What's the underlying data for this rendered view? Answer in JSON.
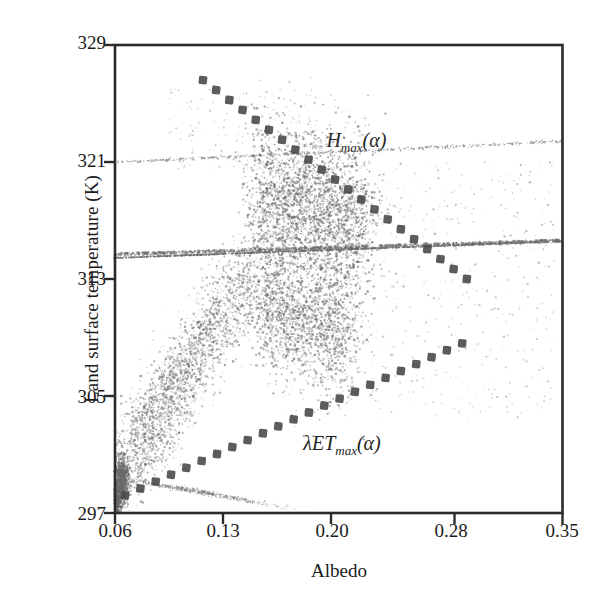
{
  "chart_data": {
    "type": "scatter",
    "title": "",
    "xlabel": "Albedo",
    "ylabel": "Land surface temperature (K)",
    "xlim": [
      0.06,
      0.35
    ],
    "ylim": [
      297,
      329
    ],
    "xticks": [
      "0.06",
      "0.13",
      "0.20",
      "0.28",
      "0.35"
    ],
    "xtick_values": [
      0.06,
      0.13,
      0.2,
      0.28,
      0.35
    ],
    "yticks": [
      "329",
      "321",
      "313",
      "305",
      "297"
    ],
    "ytick_values": [
      329,
      321,
      313,
      305,
      297
    ],
    "grid": false,
    "legend": "none",
    "point_color": "#6a6a6a",
    "cloud": {
      "center_x": 0.152,
      "center_y": 314.5,
      "dense_core_x": 0.152,
      "dense_core_y": 314.8,
      "warm_vertex_x": 0.143,
      "warm_vertex_y": 322.0,
      "dry_tail_x": 0.065,
      "dry_tail_y": 299.0
    },
    "annotations": [
      {
        "id": "hmax",
        "base": "H",
        "sub": "max",
        "arg": "(α)",
        "x": 0.197,
        "y": 322.3
      },
      {
        "id": "letmax",
        "base": "λET",
        "sub": "max",
        "arg": "(α)",
        "x": 0.182,
        "y": 301.6
      }
    ],
    "edges": [
      {
        "id": "hmax-edge",
        "label": "H_max(alpha)",
        "style": "dashed-square",
        "color": "#4a4a4a",
        "x_start": 0.117,
        "y_start": 326.6,
        "x_end": 0.288,
        "y_end": 313.0
      },
      {
        "id": "letmax-edge",
        "label": "lambdaET_max(alpha)",
        "style": "dashed-square",
        "color": "#4a4a4a",
        "x_start": 0.0665,
        "y_start": 298.2,
        "x_end": 0.285,
        "y_end": 308.6
      }
    ]
  },
  "axes": {
    "frame_color": "#2b2b2b",
    "tick_color": "#2b2b2b"
  }
}
